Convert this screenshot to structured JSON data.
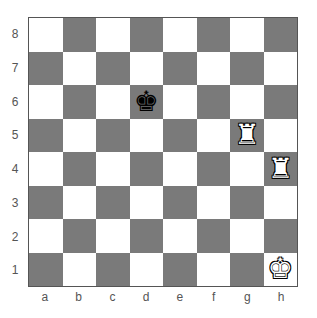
{
  "board": {
    "ranks": [
      "8",
      "7",
      "6",
      "5",
      "4",
      "3",
      "2",
      "1"
    ],
    "files": [
      "a",
      "b",
      "c",
      "d",
      "e",
      "f",
      "g",
      "h"
    ],
    "colors": {
      "light": "#ffffff",
      "dark": "#7a7a7a"
    },
    "pieces": [
      {
        "square": "d6",
        "type": "king",
        "color": "black",
        "glyph": "♚"
      },
      {
        "square": "g5",
        "type": "rook",
        "color": "white",
        "glyph": "♜"
      },
      {
        "square": "h4",
        "type": "rook",
        "color": "white",
        "glyph": "♜"
      },
      {
        "square": "h1",
        "type": "king",
        "color": "white",
        "glyph": "♚"
      }
    ]
  }
}
